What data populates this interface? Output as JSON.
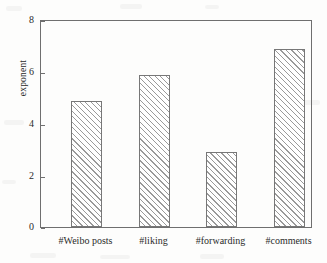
{
  "chart_data": {
    "type": "bar",
    "title": "",
    "xlabel": "",
    "ylabel": "exponent",
    "categories": [
      "#Weibo posts",
      "#liking",
      "#forwarding",
      "#comments"
    ],
    "values": [
      4.9,
      5.9,
      2.9,
      6.9
    ],
    "ylim": [
      0,
      8
    ],
    "yticks": [
      0,
      2,
      4,
      6,
      8
    ],
    "ytick_labels": [
      "0",
      "2",
      "4",
      "6",
      "8"
    ],
    "grid": false,
    "legend": false,
    "bar_fill": "hatched-diagonal",
    "bar_edge_color": "#777777",
    "axis_color": "#6f6f6f",
    "background_color": "#fdfdfc"
  },
  "axes": {
    "y_label": "exponent",
    "ticks": [
      {
        "label": "8",
        "value": 8
      },
      {
        "label": "6",
        "value": 6
      },
      {
        "label": "4",
        "value": 4
      },
      {
        "label": "2",
        "value": 2
      },
      {
        "label": "0",
        "value": 0
      }
    ]
  },
  "bars": [
    {
      "label": "#Weibo posts",
      "value": 4.9
    },
    {
      "label": "#liking",
      "value": 5.9
    },
    {
      "label": "#forwarding",
      "value": 2.9
    },
    {
      "label": "#comments",
      "value": 6.9
    }
  ]
}
